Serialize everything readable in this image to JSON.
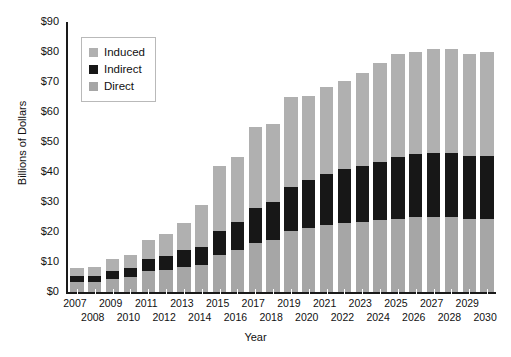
{
  "chart_data": {
    "type": "bar",
    "stacked": true,
    "title": "",
    "xlabel": "Year",
    "ylabel": "Billions of Dollars",
    "ylim": [
      0,
      90
    ],
    "ytick_labels": [
      "$90",
      "$80",
      "$70",
      "$60",
      "$50",
      "$40",
      "$30",
      "$20",
      "$10",
      "$0"
    ],
    "ytick_values": [
      90,
      80,
      70,
      60,
      50,
      40,
      30,
      20,
      10,
      0
    ],
    "grid": false,
    "legend_position": "upper-left inside",
    "categories": [
      "2007",
      "2008",
      "2009",
      "2010",
      "2011",
      "2012",
      "2013",
      "2014",
      "2015",
      "2016",
      "2017",
      "2018",
      "2019",
      "2020",
      "2021",
      "2022",
      "2023",
      "2024",
      "2025",
      "2026",
      "2027",
      "2028",
      "2029",
      "2030"
    ],
    "series": [
      {
        "name": "Direct",
        "color": "#a6a6a6",
        "values": [
          3.5,
          3.5,
          4.5,
          5.0,
          7.0,
          7.5,
          8.5,
          9.0,
          12.5,
          14.0,
          16.5,
          17.5,
          20.5,
          21.5,
          22.5,
          23.0,
          23.5,
          24.0,
          24.5,
          25.0,
          25.0,
          25.0,
          24.5,
          24.5
        ]
      },
      {
        "name": "Indirect",
        "color": "#171717",
        "values": [
          2.0,
          2.0,
          2.5,
          3.0,
          4.0,
          4.5,
          5.5,
          6.0,
          8.0,
          9.5,
          11.5,
          12.5,
          14.5,
          16.0,
          17.0,
          18.0,
          18.5,
          19.5,
          20.5,
          21.0,
          21.5,
          21.5,
          21.0,
          21.0
        ]
      },
      {
        "name": "Induced",
        "color": "#b0b0b0",
        "values": [
          2.5,
          3.0,
          4.0,
          4.5,
          6.5,
          7.5,
          9.0,
          14.0,
          21.5,
          21.5,
          27.0,
          26.0,
          30.0,
          28.0,
          29.0,
          29.5,
          31.0,
          33.0,
          34.5,
          34.0,
          34.5,
          34.5,
          34.0,
          34.5
        ]
      }
    ],
    "totals": [
      8,
      8.5,
      11,
      12.5,
      17.5,
      19.5,
      23,
      29,
      42,
      45,
      55,
      56,
      65,
      65.5,
      68.5,
      70.5,
      73,
      76.5,
      79.5,
      80,
      81,
      81,
      79.5,
      80
    ]
  },
  "legend": {
    "items": [
      {
        "label": "Induced",
        "color": "#b0b0b0"
      },
      {
        "label": "Indirect",
        "color": "#171717"
      },
      {
        "label": "Direct",
        "color": "#a6a6a6"
      }
    ]
  },
  "axes": {
    "x_title": "Year",
    "y_title": "Billions of Dollars"
  }
}
